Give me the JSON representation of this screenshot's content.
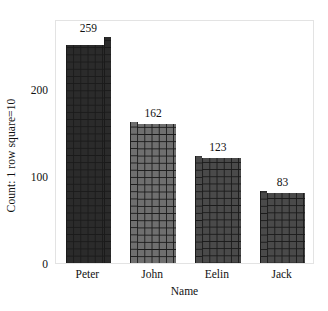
{
  "chart_data": {
    "type": "bar",
    "title": "",
    "subtitle": "",
    "categories": [
      "Peter",
      "John",
      "Eelin",
      "Jack"
    ],
    "values": [
      259,
      162,
      123,
      83
    ],
    "value_labels": [
      "259",
      "162",
      "123",
      "83"
    ],
    "xlabel": "Name",
    "ylabel": "Count: 1 row square=10",
    "ylim": [
      0,
      280
    ],
    "xlim_categories": 4,
    "yticks": [
      0,
      100,
      200
    ],
    "ytick_labels": [
      "0",
      "100",
      "200"
    ],
    "grid": false,
    "legend": "none",
    "annotations": [
      "Each bar is drawn as a stack of small squares; 1 row square = 10 counts",
      "Partial top square indicates the remainder beyond the last full row"
    ],
    "bar_colors": [
      "#2b2b2b",
      "#6f6f6f",
      "#4a4a4a",
      "#4a4a4a"
    ],
    "bar_grid_line_color": "#1a1a1a",
    "plot_frame_color": "#e3e3e3",
    "background_color": "#ffffff",
    "text_color": "#111111"
  }
}
